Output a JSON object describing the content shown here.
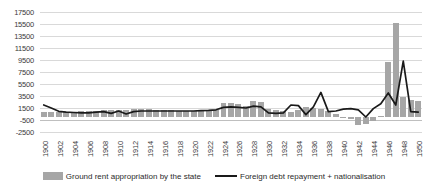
{
  "chart_data": {
    "type": "bar",
    "title": "",
    "subtitle": "",
    "xlabel": "",
    "ylabel": "",
    "ylim": [
      -2500,
      17500
    ],
    "ytick_labels": [
      "17500",
      "15500",
      "13500",
      "11500",
      "9500",
      "7500",
      "5500",
      "3500",
      "1500",
      "-500",
      "-2500"
    ],
    "ytick_values": [
      17500,
      15500,
      13500,
      11500,
      9500,
      7500,
      5500,
      3500,
      1500,
      -500,
      -2500
    ],
    "grid": true,
    "legend_position": "bottom",
    "x": [
      1900,
      1901,
      1902,
      1903,
      1904,
      1905,
      1906,
      1907,
      1908,
      1909,
      1910,
      1911,
      1912,
      1913,
      1914,
      1915,
      1916,
      1917,
      1918,
      1919,
      1920,
      1921,
      1922,
      1923,
      1924,
      1925,
      1926,
      1927,
      1928,
      1929,
      1930,
      1931,
      1932,
      1933,
      1934,
      1935,
      1936,
      1937,
      1938,
      1939,
      1940,
      1941,
      1942,
      1943,
      1944,
      1945,
      1946,
      1947,
      1948,
      1949,
      1950
    ],
    "xtick_labels": [
      "1900",
      "1902",
      "1904",
      "1906",
      "1908",
      "1910",
      "1912",
      "1914",
      "1916",
      "1918",
      "1920",
      "1922",
      "1924",
      "1926",
      "1928",
      "1930",
      "1932",
      "1934",
      "1936",
      "1938",
      "1940",
      "1942",
      "1944",
      "1946",
      "1948",
      "1950"
    ],
    "series": [
      {
        "name": "Ground rent appropriation by the state",
        "type": "bar",
        "color": "#a6a6a6",
        "values": [
          900,
          850,
          800,
          820,
          900,
          950,
          1000,
          1050,
          1100,
          1150,
          1200,
          1250,
          1300,
          1350,
          1300,
          1200,
          1150,
          1100,
          1050,
          1000,
          1000,
          1050,
          1000,
          1100,
          2300,
          2400,
          2100,
          1900,
          2600,
          2500,
          1400,
          1200,
          1000,
          900,
          1100,
          1700,
          1500,
          1300,
          1000,
          500,
          -100,
          -400,
          -1300,
          -1200,
          -600,
          200,
          9200,
          15700,
          3400,
          2800,
          2600
        ]
      },
      {
        "name": "Foreign debt repayment + nationalisation",
        "type": "line",
        "color": "#1a1a1a",
        "values": [
          2000,
          1500,
          950,
          800,
          750,
          700,
          700,
          800,
          900,
          600,
          1000,
          500,
          900,
          1000,
          1000,
          1000,
          1000,
          1000,
          1000,
          1000,
          1000,
          1050,
          1100,
          1200,
          1600,
          1700,
          1600,
          1500,
          1800,
          1700,
          700,
          600,
          700,
          2000,
          1900,
          400,
          1700,
          4100,
          900,
          1000,
          1300,
          1400,
          1200,
          0,
          1400,
          2200,
          4000,
          2000,
          9300,
          900,
          800
        ]
      }
    ]
  },
  "legend": {
    "entries": [
      {
        "label": "Ground rent appropriation by the state",
        "swatch": "bar",
        "color": "#a6a6a6"
      },
      {
        "label": "Foreign debt repayment + nationalisation",
        "swatch": "line",
        "color": "#1a1a1a"
      }
    ]
  }
}
